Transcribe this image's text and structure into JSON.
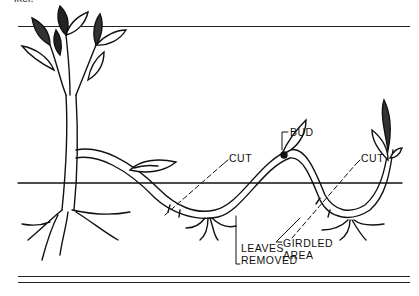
{
  "figure": {
    "top_fragment": "ikel.",
    "labels": {
      "bud": "BUD",
      "cut_left": "CUT",
      "cut_right": "CUT",
      "leaves_removed_line1": "LEAVES",
      "leaves_removed_line2": "REMOVED",
      "girdled_area_line1": "GIRDLED",
      "girdled_area_line2": "AREA"
    }
  },
  "colors": {
    "ink": "#111111",
    "background": "#ffffff"
  }
}
